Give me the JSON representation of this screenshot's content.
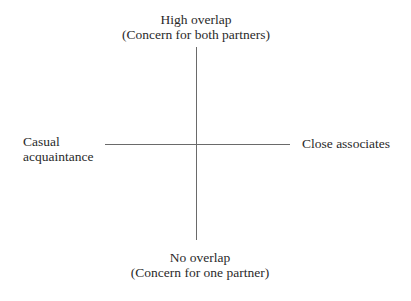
{
  "diagram": {
    "type": "quadrant-axes",
    "vertical_axis": {
      "top_label": [
        "High overlap",
        "(Concern for both partners)"
      ],
      "bottom_label": [
        "No overlap",
        "(Concern for one partner)"
      ]
    },
    "horizontal_axis": {
      "left_label": [
        "Casual",
        "acquaintance"
      ],
      "right_label": [
        "Close associates"
      ]
    },
    "colors": {
      "line": "#6a6a6a",
      "text": "#2a2a2a",
      "background": "#ffffff"
    }
  }
}
